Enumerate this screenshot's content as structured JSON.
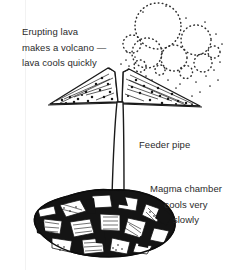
{
  "figure": {
    "background_color": "#ffffff",
    "ink_color": "#1a1a1a",
    "text_color": "#2b2b2b"
  },
  "labels": {
    "erupting": {
      "name": "erupting-lava-label",
      "lines": [
        "Erupting lava",
        "makes a volcano —",
        "lava cools quickly"
      ],
      "text": "Erupting lava\nmakes a volcano —\nlava cools quickly"
    },
    "feeder": {
      "name": "feeder-pipe-label",
      "lines": [
        "Feeder pipe"
      ],
      "text": "Feeder pipe"
    },
    "magma": {
      "name": "magma-chamber-label",
      "lines": [
        "Magma chamber",
        "cools very",
        "slowly"
      ],
      "text": "Magma chamber\ncools very\nslowly"
    }
  },
  "parts": [
    {
      "id": "ash-plume",
      "label": "Ash plume",
      "style": "dotted circular puffs rising to upper right"
    },
    {
      "id": "volcano-cone",
      "label": "Volcano cone",
      "style": "two concave stippled flanks with layered beds"
    },
    {
      "id": "crater-vent",
      "label": "Crater vent",
      "style": "V-shaped notch at summit"
    },
    {
      "id": "feeder-pipe",
      "label": "Feeder pipe",
      "style": "narrow vertical conduit"
    },
    {
      "id": "magma-chamber",
      "label": "Magma chamber",
      "style": "dark blob with angular white crystals"
    }
  ]
}
